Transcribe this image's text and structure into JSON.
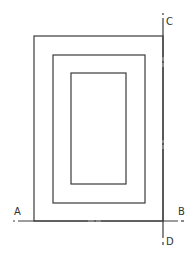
{
  "diagram": {
    "type": "section-plane drawing",
    "colors": {
      "line": "#3a3a3a",
      "label": "#333333",
      "background": "#ffffff"
    },
    "rectangles": [
      {
        "name": "outer",
        "x": 34,
        "y": 36,
        "width": 129,
        "height": 185
      },
      {
        "name": "middle",
        "x": 53,
        "y": 55,
        "width": 92,
        "height": 148
      },
      {
        "name": "inner",
        "x": 71,
        "y": 73,
        "width": 55,
        "height": 111
      }
    ],
    "section_lines": [
      {
        "name": "A-B",
        "orientation": "horizontal",
        "start_label": "A",
        "end_label": "B"
      },
      {
        "name": "C-D",
        "orientation": "vertical",
        "start_label": "C",
        "end_label": "D"
      }
    ],
    "labels": {
      "a": "A",
      "b": "B",
      "c": "C",
      "d": "D"
    }
  }
}
